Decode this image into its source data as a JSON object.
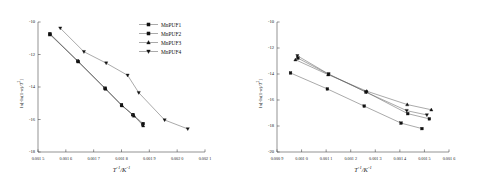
{
  "figure": {
    "panels": [
      "left",
      "right"
    ],
    "series_names": [
      "MnPUF1",
      "MnPUF2",
      "MnPUF3",
      "MnPUF4"
    ],
    "marker_shapes": [
      "square",
      "square",
      "triangle-up",
      "triangle-down"
    ],
    "line_color": "#555555",
    "marker_color": "#111111",
    "axis_color": "#4a4a4a"
  },
  "legend": {
    "items": [
      {
        "label": "MnPUF1",
        "marker": "square"
      },
      {
        "label": "MnPUF2",
        "marker": "square"
      },
      {
        "label": "MnPUF3",
        "marker": "triangle-up"
      },
      {
        "label": "MnPUF4",
        "marker": "triangle-down"
      }
    ]
  },
  "chart_data": [
    {
      "panel": "left",
      "type": "scatter",
      "title": "",
      "xlabel": "T⁻¹/K⁻¹",
      "ylabel": "ln[-ln(1-α)/T²]",
      "xlim": [
        0.0015,
        0.0021
      ],
      "ylim": [
        -18,
        -10
      ],
      "xticks": [
        0.0015,
        0.0016,
        0.0017,
        0.0018,
        0.0019,
        0.002,
        0.0021
      ],
      "xticklabels": [
        "0.001 5",
        "0.001 6",
        "0.001 7",
        "0.001 8",
        "0.001 9",
        "0.002 0",
        "0.002 1"
      ],
      "yticks": [
        -10,
        -12,
        -14,
        -16,
        -18
      ],
      "yticklabels": [
        "-10",
        "-12",
        "-14",
        "-16",
        "-18"
      ],
      "grid": false,
      "legend_position": "top-right",
      "series": [
        {
          "name": "MnPUF1",
          "marker": "square",
          "x": [
            0.001543,
            0.001642,
            0.00174,
            0.0018,
            0.00184,
            0.001878
          ],
          "y": [
            -10.72,
            -12.4,
            -14.07,
            -15.1,
            -15.7,
            -16.25
          ]
        },
        {
          "name": "MnPUF2",
          "marker": "square",
          "x": [
            0.001543,
            0.001645,
            0.001742,
            0.0018,
            0.001842,
            0.001876
          ],
          "y": [
            -10.78,
            -12.43,
            -14.1,
            -15.12,
            -15.72,
            -16.3
          ]
        },
        {
          "name": "MnPUF3",
          "marker": "triangle-up",
          "x": [
            0.001543,
            0.001645,
            0.001743,
            0.001802,
            0.001845,
            0.001878
          ],
          "y": [
            -10.74,
            -12.45,
            -14.12,
            -15.15,
            -15.78,
            -16.38
          ]
        },
        {
          "name": "MnPUF4",
          "marker": "triangle-down",
          "x": [
            0.00158,
            0.001665,
            0.001745,
            0.001822,
            0.001862,
            0.001955,
            0.002038
          ],
          "y": [
            -10.38,
            -11.83,
            -12.53,
            -13.28,
            -14.35,
            -16.03,
            -16.58
          ]
        }
      ]
    },
    {
      "panel": "right",
      "type": "scatter",
      "title": "",
      "xlabel": "T⁻¹/K⁻¹",
      "ylabel": "ln[-ln(1-α)/T²]",
      "xlim": [
        0.0009,
        0.0016
      ],
      "ylim": [
        -20,
        -10
      ],
      "xticks": [
        0.0009,
        0.001,
        0.0011,
        0.0012,
        0.0013,
        0.0014,
        0.0015,
        0.0016
      ],
      "xticklabels": [
        "0.000 9",
        "0.001 0",
        "0.001 1",
        "0.001 2",
        "0.001 3",
        "0.001 4",
        "0.001 5",
        "0.001 6"
      ],
      "yticks": [
        -10,
        -12,
        -14,
        -16,
        -18,
        -20
      ],
      "yticklabels": [
        "-10",
        "-12",
        "-14",
        "-16",
        "-18",
        "-20"
      ],
      "grid": false,
      "legend_position": "top-right",
      "series": [
        {
          "name": "MnPUF1",
          "marker": "square",
          "x": [
            0.000955,
            0.001105,
            0.001255,
            0.001405,
            0.00149
          ],
          "y": [
            -13.92,
            -15.15,
            -16.47,
            -17.78,
            -18.2
          ]
        },
        {
          "name": "MnPUF2",
          "marker": "square",
          "x": [
            0.000985,
            0.00111,
            0.001262,
            0.001432,
            0.00152
          ],
          "y": [
            -12.78,
            -14.02,
            -15.38,
            -17.05,
            -17.45
          ]
        },
        {
          "name": "MnPUF3",
          "marker": "triangle-up",
          "x": [
            0.000975,
            0.001108,
            0.001265,
            0.00143,
            0.001528
          ],
          "y": [
            -12.9,
            -14.05,
            -15.32,
            -16.35,
            -16.75
          ]
        },
        {
          "name": "MnPUF4",
          "marker": "triangle-down",
          "x": [
            0.000983,
            0.00111,
            0.001263,
            0.001428,
            0.00151
          ],
          "y": [
            -12.6,
            -14.0,
            -15.4,
            -16.82,
            -17.15
          ]
        }
      ]
    }
  ]
}
